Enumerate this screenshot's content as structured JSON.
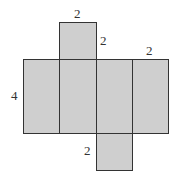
{
  "diagram": {
    "type": "net of rectangular prism",
    "fill_color": "#cfcfcf",
    "stroke_color": "#333333",
    "labels": {
      "top_width": "2",
      "top_height": "2",
      "right_face_width": "2",
      "left_height": "4",
      "bottom_left": "2"
    }
  }
}
